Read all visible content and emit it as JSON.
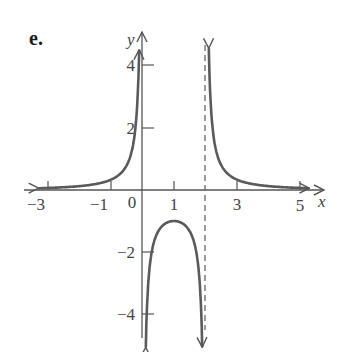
{
  "figure": {
    "part_label": "e.",
    "axis_labels": {
      "x": "x",
      "y": "y"
    },
    "x_tick_labels": [
      "−3",
      "−1",
      "0",
      "1",
      "3",
      "5"
    ],
    "y_tick_labels": [
      "4",
      "2",
      "−2",
      "−4"
    ],
    "colors": {
      "axis": "#555555",
      "curve": "#5a5a5a",
      "asymptote": "#6a6a6a",
      "text": "#444444"
    }
  },
  "chart_data": {
    "type": "line",
    "title": "e.",
    "xlabel": "x",
    "ylabel": "y",
    "xlim": [
      -3.3,
      5.4
    ],
    "ylim": [
      -4.5,
      4.6
    ],
    "grid": false,
    "legend": null,
    "x_ticks": [
      -3,
      -1,
      1,
      2,
      3,
      5
    ],
    "x_tick_labels": [
      "-3",
      "-1",
      "0",
      "1",
      "3",
      "5"
    ],
    "y_ticks": [
      -4,
      -2,
      2,
      4
    ],
    "y_tick_labels": [
      "-4",
      "-2",
      "2",
      "4"
    ],
    "vertical_asymptotes": [
      0,
      2
    ],
    "asymptote_style": {
      "x=2": "dashed",
      "x=0": "coincides with y-axis"
    },
    "horizontal_asymptote": 0,
    "function_description": "f(x) = 1/(x(x-2))",
    "series": [
      {
        "name": "left branch (x<0)",
        "x": [
          -3.2,
          -3,
          -2,
          -1,
          -0.5,
          -0.3,
          -0.2
        ],
        "y": [
          0.06,
          0.067,
          0.125,
          0.333,
          0.8,
          1.45,
          2.27
        ]
      },
      {
        "name": "middle branch (0<x<2)",
        "x": [
          0.25,
          0.5,
          0.75,
          1,
          1.25,
          1.5,
          1.75
        ],
        "y": [
          -2.29,
          -1.33,
          -1.07,
          -1.0,
          -1.07,
          -1.33,
          -2.29
        ]
      },
      {
        "name": "right branch (x>2)",
        "x": [
          2.2,
          2.5,
          3,
          4,
          5,
          5.2
        ],
        "y": [
          2.27,
          0.8,
          0.333,
          0.125,
          0.067,
          0.06
        ]
      }
    ],
    "annotations": [
      "local maximum at (1, -1)",
      "arrows indicate branches continue to ±infinity near asymptotes"
    ]
  }
}
